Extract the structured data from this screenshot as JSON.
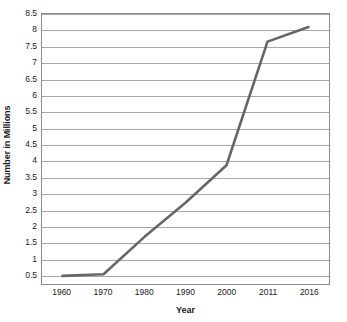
{
  "chart_data": {
    "type": "line",
    "title": "",
    "xlabel": "Year",
    "ylabel": "Number in Millions",
    "categories": [
      "1960",
      "1970",
      "1980",
      "1990",
      "2000",
      "2011",
      "2016"
    ],
    "series": [
      {
        "name": "Number in Millions",
        "values": [
          0.45,
          0.5,
          1.65,
          2.7,
          3.85,
          7.65,
          8.1
        ],
        "color": "#666666"
      }
    ],
    "ylim": [
      0.2,
      8.5
    ],
    "ytick_labels": [
      "8.5",
      "8",
      "7.5",
      "7",
      "6.5",
      "6",
      "5.5",
      "5",
      "4.5",
      "4",
      "3.5",
      "3",
      "2.5",
      "2",
      "1.5",
      "1",
      "0.5"
    ],
    "ytick_values": [
      8.5,
      8,
      7.5,
      7,
      6.5,
      6,
      5.5,
      5,
      4.5,
      4,
      3.5,
      3,
      2.5,
      2,
      1.5,
      1,
      0.5
    ],
    "grid": true,
    "grid_axis": "y",
    "legend": false,
    "legend_position": "none",
    "grid_color": "#a8a8a8",
    "axis_color": "#8c8c8c",
    "background_color": "#ffffff",
    "text_color": "#1a1a1a"
  }
}
